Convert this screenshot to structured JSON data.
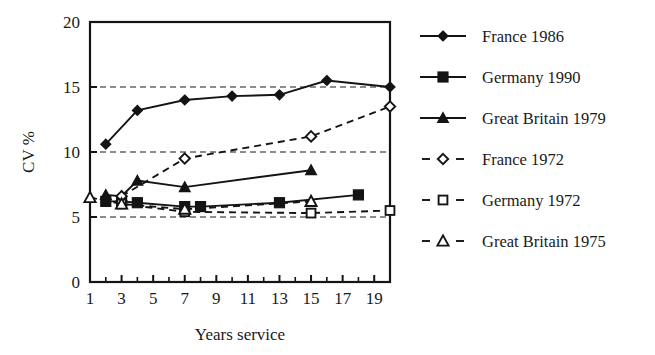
{
  "chart_data": {
    "type": "line",
    "title": "",
    "xlabel": "Years service",
    "ylabel": "CV %",
    "xlim": [
      1,
      20
    ],
    "ylim": [
      0,
      20
    ],
    "grid": "horizontal dashed at 5, 10, 15",
    "legend_position": "right",
    "x_ticks_all": [
      1,
      2,
      3,
      4,
      5,
      6,
      7,
      8,
      9,
      10,
      11,
      12,
      13,
      14,
      15,
      16,
      17,
      18,
      19,
      20
    ],
    "x_tick_labels": [
      "1",
      "3",
      "5",
      "7",
      "9",
      "11",
      "13",
      "15",
      "17",
      "19"
    ],
    "x_tick_label_values": [
      1,
      3,
      5,
      7,
      9,
      11,
      13,
      15,
      17,
      19
    ],
    "y_ticks": [
      0,
      5,
      10,
      15,
      20
    ],
    "y_tick_labels": [
      "0",
      "5",
      "10",
      "15",
      "20"
    ],
    "series": [
      {
        "name": "France 1986",
        "marker": "filled-diamond",
        "line": "solid",
        "x": [
          2,
          4,
          7,
          10,
          13,
          16,
          20
        ],
        "y": [
          10.6,
          13.2,
          14.0,
          14.3,
          14.4,
          15.5,
          15.0
        ]
      },
      {
        "name": "Germany 1990",
        "marker": "filled-square",
        "line": "solid",
        "x": [
          2,
          3,
          4,
          7,
          8,
          13,
          18
        ],
        "y": [
          6.2,
          6.2,
          6.1,
          5.8,
          5.8,
          6.1,
          6.7
        ]
      },
      {
        "name": "Great Britain 1979",
        "marker": "filled-triangle",
        "line": "solid",
        "x": [
          2,
          3,
          4,
          7,
          15
        ],
        "y": [
          6.7,
          6.6,
          7.8,
          7.3,
          8.6
        ]
      },
      {
        "name": "France 1972",
        "marker": "open-diamond",
        "line": "dashed",
        "x": [
          3,
          7,
          15,
          20
        ],
        "y": [
          6.6,
          9.5,
          11.2,
          13.5
        ]
      },
      {
        "name": "Germany 1972",
        "marker": "open-square",
        "line": "dashed",
        "x": [
          3,
          7,
          15,
          20
        ],
        "y": [
          6.0,
          5.4,
          5.3,
          5.5
        ]
      },
      {
        "name": "Great Britain 1975",
        "marker": "open-triangle",
        "line": "dashed",
        "x": [
          1,
          3,
          7,
          15
        ],
        "y": [
          6.5,
          6.0,
          5.6,
          6.2
        ]
      }
    ]
  },
  "legend": {
    "items": [
      {
        "label": "France 1986",
        "marker": "filled-diamond",
        "line": "solid"
      },
      {
        "label": "Germany 1990",
        "marker": "filled-square",
        "line": "solid"
      },
      {
        "label": "Great Britain 1979",
        "marker": "filled-triangle",
        "line": "solid"
      },
      {
        "label": "France 1972",
        "marker": "open-diamond",
        "line": "dashed"
      },
      {
        "label": "Germany 1972",
        "marker": "open-square",
        "line": "dashed"
      },
      {
        "label": "Great Britain 1975",
        "marker": "open-triangle",
        "line": "dashed"
      }
    ]
  },
  "colors": {
    "ink": "#141414",
    "background": "#ffffff"
  }
}
